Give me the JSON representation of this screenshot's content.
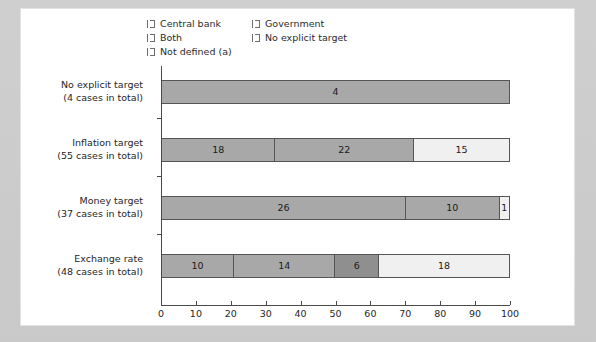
{
  "chart_data": {
    "type": "bar",
    "orientation": "horizontal",
    "stacked": true,
    "title": "",
    "subtitle": "",
    "xlabel": "",
    "ylabel": "",
    "xlim": [
      0,
      100
    ],
    "xticks": [
      0,
      10,
      20,
      30,
      40,
      50,
      60,
      70,
      80,
      90,
      100
    ],
    "grid": false,
    "legend_position": "top",
    "legend": [
      {
        "label": "Central bank",
        "color": "#a8a8a8"
      },
      {
        "label": "Government",
        "color": "#f2f2f2"
      },
      {
        "label": "Both",
        "color": "#a8a8a8"
      },
      {
        "label": "No explicit target",
        "color": "#9a9a9a"
      },
      {
        "label": "Not defined (a)",
        "color": "#a0a0a0"
      }
    ],
    "categories": [
      {
        "name": "No explicit target",
        "sublabel": "(4 cases in total)",
        "total_cases": 4,
        "segments": [
          {
            "series": "Not defined (a)",
            "value": 4,
            "percent": 100.0,
            "color": "#a8a8a8"
          }
        ]
      },
      {
        "name": "Inflation target",
        "sublabel": "(55 cases in total)",
        "total_cases": 55,
        "segments": [
          {
            "series": "Central bank",
            "value": 18,
            "percent": 32.7,
            "color": "#a8a8a8"
          },
          {
            "series": "Both",
            "value": 22,
            "percent": 40.0,
            "color": "#a8a8a8"
          },
          {
            "series": "Government",
            "value": 15,
            "percent": 27.3,
            "color": "#f0f0f0"
          }
        ]
      },
      {
        "name": "Money target",
        "sublabel": "(37 cases in total)",
        "total_cases": 37,
        "segments": [
          {
            "series": "Central bank",
            "value": 26,
            "percent": 70.3,
            "color": "#a8a8a8"
          },
          {
            "series": "Both",
            "value": 10,
            "percent": 27.0,
            "color": "#a8a8a8"
          },
          {
            "series": "Government",
            "value": 1,
            "percent": 2.7,
            "color": "#f0f0f0"
          }
        ]
      },
      {
        "name": "Exchange rate",
        "sublabel": "(48 cases in total)",
        "total_cases": 48,
        "segments": [
          {
            "series": "Central bank",
            "value": 10,
            "percent": 20.8,
            "color": "#a8a8a8"
          },
          {
            "series": "Both",
            "value": 14,
            "percent": 29.2,
            "color": "#a8a8a8"
          },
          {
            "series": "No explicit target",
            "value": 6,
            "percent": 12.5,
            "color": "#8f8f8f"
          },
          {
            "series": "Government",
            "value": 18,
            "percent": 37.5,
            "color": "#f0f0f0"
          }
        ]
      }
    ]
  }
}
